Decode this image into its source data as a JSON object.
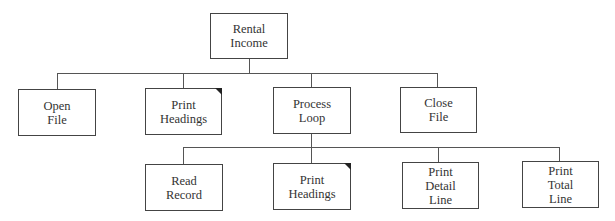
{
  "diagram": {
    "type": "hierarchy-chart",
    "root": {
      "label": "Rental\nIncome"
    },
    "level1": [
      {
        "label": "Open\nFile",
        "marked": false
      },
      {
        "label": "Print\nHeadings",
        "marked": true
      },
      {
        "label": "Process\nLoop",
        "marked": false
      },
      {
        "label": "Close\nFile",
        "marked": false
      }
    ],
    "level2": [
      {
        "label": "Read\nRecord",
        "marked": false
      },
      {
        "label": "Print\nHeadings",
        "marked": true
      },
      {
        "label": "Print\nDetail\nLine",
        "marked": false
      },
      {
        "label": "Print\nTotal\nLine",
        "marked": false
      }
    ],
    "edges": [
      [
        "Rental Income",
        "Open File"
      ],
      [
        "Rental Income",
        "Print Headings"
      ],
      [
        "Rental Income",
        "Process Loop"
      ],
      [
        "Rental Income",
        "Close File"
      ],
      [
        "Process Loop",
        "Read Record"
      ],
      [
        "Process Loop",
        "Print Headings"
      ],
      [
        "Process Loop",
        "Print Detail Line"
      ],
      [
        "Process Loop",
        "Print Total Line"
      ]
    ],
    "colors": {
      "line": "#555555",
      "border": "#444444",
      "text": "#333333",
      "marker": "#222222"
    }
  }
}
